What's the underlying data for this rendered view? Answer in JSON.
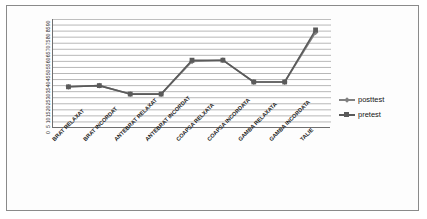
{
  "chart_data": {
    "type": "line",
    "title": "",
    "subtitle": "",
    "xlabel": "",
    "ylabel": "",
    "ylim": [
      0,
      90
    ],
    "ytick_step": 5,
    "grid": true,
    "legend_position": "right",
    "categories": [
      "BRAT RELAXAT",
      "BRAT INCORDAT",
      "ANTEBRAT RELAXAT",
      "ANTEBRAT INCORDAT",
      "COAPSA RELXATA",
      "COAPSA INCORDATA",
      "GAMBA RELAXATA",
      "GAMBA INCORDATA",
      "TALIE"
    ],
    "ytick_labels": [
      "0",
      "5",
      "10",
      "15",
      "20",
      "25",
      "30",
      "35",
      "40",
      "45",
      "50",
      "55",
      "60",
      "65",
      "70",
      "75",
      "80",
      "85",
      "90"
    ],
    "series": [
      {
        "name": "posttest",
        "marker": "diamond",
        "color": "#808080",
        "values": [
          34,
          35,
          28,
          28,
          55,
          56,
          38,
          38,
          79
        ]
      },
      {
        "name": "pretest",
        "marker": "square",
        "color": "#5a5a5a",
        "values": [
          34,
          35,
          28,
          28,
          56,
          56,
          38,
          38,
          81
        ]
      }
    ]
  },
  "legend": {
    "items": [
      {
        "label": "posttest",
        "marker": "diamond"
      },
      {
        "label": "pretest",
        "marker": "square"
      }
    ]
  },
  "colors": {
    "frame_border": "#8a8a8a",
    "axis": "#6f6f6f",
    "gridline": "#9a9a9a",
    "background": "#ffffff"
  }
}
